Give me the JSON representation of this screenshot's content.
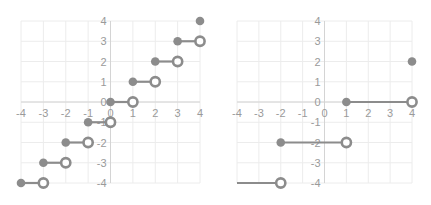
{
  "chart_data": [
    {
      "type": "scatter",
      "title": "",
      "subtitle": "Step function (floor): y = floor(x)",
      "xlabel": "",
      "ylabel": "",
      "xlim": [
        -4,
        4
      ],
      "ylim": [
        -4,
        4
      ],
      "x_ticks": [
        "-4",
        "-3",
        "-2",
        "-1",
        "0",
        "1",
        "2",
        "3",
        "4"
      ],
      "y_ticks": [
        "4",
        "3",
        "2",
        "1",
        "0",
        "-1",
        "-2",
        "-3",
        "-4"
      ],
      "grid": true,
      "legend": "none",
      "segments": [
        {
          "x_start": -4,
          "x_end": -3,
          "y": -4,
          "start": "closed",
          "end": "open"
        },
        {
          "x_start": -3,
          "x_end": -2,
          "y": -3,
          "start": "closed",
          "end": "open"
        },
        {
          "x_start": -2,
          "x_end": -1,
          "y": -2,
          "start": "closed",
          "end": "open"
        },
        {
          "x_start": -1,
          "x_end": 0,
          "y": -1,
          "start": "closed",
          "end": "open"
        },
        {
          "x_start": 0,
          "x_end": 1,
          "y": 0,
          "start": "closed",
          "end": "open"
        },
        {
          "x_start": 1,
          "x_end": 2,
          "y": 1,
          "start": "closed",
          "end": "open"
        },
        {
          "x_start": 2,
          "x_end": 3,
          "y": 2,
          "start": "closed",
          "end": "open"
        },
        {
          "x_start": 3,
          "x_end": 4,
          "y": 3,
          "start": "closed",
          "end": "open"
        }
      ],
      "points": [
        {
          "x": 4,
          "y": 4,
          "style": "closed"
        }
      ]
    },
    {
      "type": "scatter",
      "title": "",
      "subtitle": "Piecewise step function",
      "xlabel": "",
      "ylabel": "",
      "xlim": [
        -4,
        4
      ],
      "ylim": [
        -4,
        4
      ],
      "x_ticks": [
        "-4",
        "-3",
        "-2",
        "-1",
        "0",
        "1",
        "2",
        "3",
        "4"
      ],
      "y_ticks": [
        "4",
        "3",
        "2",
        "1",
        "0",
        "-1",
        "-2",
        "-3",
        "-4"
      ],
      "grid": true,
      "legend": "none",
      "segments": [
        {
          "x_start": -4,
          "x_end": -2,
          "y": -4,
          "start": "none",
          "end": "open"
        },
        {
          "x_start": -2,
          "x_end": 1,
          "y": -2,
          "start": "closed",
          "end": "open"
        },
        {
          "x_start": 1,
          "x_end": 4,
          "y": 0,
          "start": "closed",
          "end": "open"
        }
      ],
      "points": [
        {
          "x": 4,
          "y": 2,
          "style": "closed"
        }
      ]
    }
  ],
  "style": {
    "marker_color": "#8c8c8c",
    "grid_color": "#ececec",
    "axis_color": "#d4d4d4",
    "tick_color": "#9a9a9a"
  }
}
